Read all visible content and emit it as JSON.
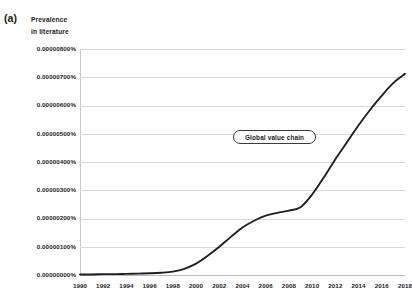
{
  "figure": {
    "panel_label": "(a)",
    "y_axis_title_line1": "Prevalence",
    "y_axis_title_line2": "in literature"
  },
  "annotations": [
    {
      "name": "global-value-chain",
      "text": "Global value chain"
    }
  ],
  "colors": {
    "series_line": "#231f20",
    "gridline": "#d9d9d9",
    "baseline": "#b9b9b9",
    "frame": "#c9c9c9",
    "text": "#1b1b1b",
    "background": "#ffffff"
  },
  "chart_data": {
    "type": "line",
    "title": "",
    "subtitle": "",
    "xlabel": "",
    "ylabel": "Prevalence in literature",
    "xlim": [
      1990,
      2018
    ],
    "ylim": [
      0.0,
      8e-06
    ],
    "grid": "horizontal",
    "legend": "none",
    "x_tick_labels": [
      "1990",
      "1992",
      "1994",
      "1996",
      "1998",
      "2000",
      "2002",
      "2004",
      "2006",
      "2008",
      "2010",
      "2012",
      "2014",
      "2016",
      "2018"
    ],
    "x_ticks": [
      1990,
      1992,
      1994,
      1996,
      1998,
      2000,
      2002,
      2004,
      2006,
      2008,
      2010,
      2012,
      2014,
      2016,
      2018
    ],
    "y_tick_labels": [
      "0.00000000%",
      "0.00000100%",
      "0.00000200%",
      "0.00000300%",
      "0.00000400%",
      "0.00000500%",
      "0.00000600%",
      "0.00000700%",
      "0.00000800%"
    ],
    "y_ticks": [
      0.0,
      1e-06,
      2e-06,
      3e-06,
      4e-06,
      5e-06,
      6e-06,
      7e-06,
      8e-06
    ],
    "series": [
      {
        "name": "Global value chain",
        "x": [
          1990,
          1991,
          1992,
          1993,
          1994,
          1995,
          1996,
          1997,
          1998,
          1999,
          2000,
          2001,
          2002,
          2003,
          2004,
          2005,
          2006,
          2007,
          2008,
          2009,
          2010,
          2011,
          2012,
          2013,
          2014,
          2015,
          2016,
          2017,
          2018
        ],
        "values": [
          2e-08,
          2e-08,
          3e-08,
          3e-08,
          4e-08,
          5e-08,
          6e-08,
          8e-08,
          1.2e-07,
          2.2e-07,
          4e-07,
          6.8e-07,
          1e-06,
          1.35e-06,
          1.68e-06,
          1.92e-06,
          2.1e-06,
          2.2e-06,
          2.28e-06,
          2.4e-06,
          2.85e-06,
          3.45e-06,
          4.1e-06,
          4.7e-06,
          5.3e-06,
          5.85e-06,
          6.35e-06,
          6.8e-06,
          7.12e-06
        ]
      }
    ]
  }
}
